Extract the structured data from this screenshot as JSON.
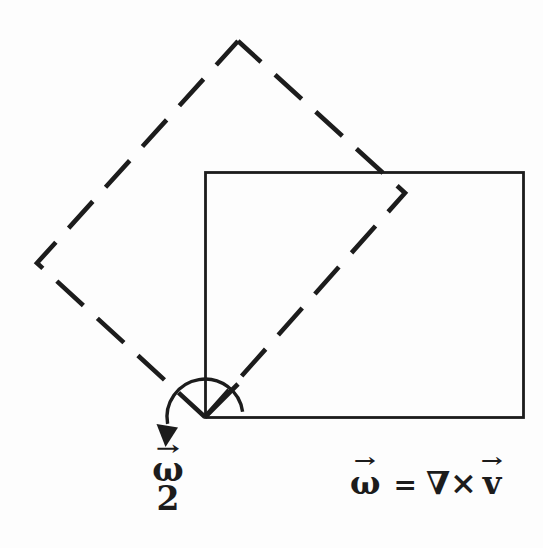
{
  "colors": {
    "ink": "#1c1c1c",
    "background": "#fdfdfd"
  },
  "labels": {
    "rotation_rate_fraction": {
      "vector_arrow": "→",
      "numerator": "ω",
      "denominator": "2"
    },
    "vorticity_equation": {
      "omega_vector_arrow": "→",
      "omega": "ω",
      "equals": "=",
      "nabla": "∇",
      "cross": "×",
      "v_vector_arrow": "→",
      "v": "v"
    }
  }
}
